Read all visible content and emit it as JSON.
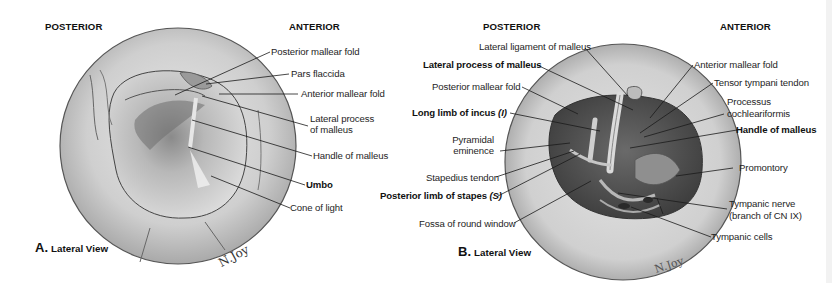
{
  "panel_a": {
    "orientation": {
      "posterior": "POSTERIOR",
      "anterior": "ANTERIOR"
    },
    "caption": {
      "letter": "A.",
      "text": "Lateral View"
    },
    "signature": "N.Joy",
    "labels": [
      {
        "text": "Posterior mallear fold",
        "bold": false
      },
      {
        "text": "Pars flaccida",
        "bold": false
      },
      {
        "text": "Anterior mallear fold",
        "bold": false
      },
      {
        "text": "Lateral process",
        "bold": false
      },
      {
        "text": "of malleus",
        "bold": false
      },
      {
        "text": "Handle of malleus",
        "bold": false
      },
      {
        "text": "Umbo",
        "bold": true
      },
      {
        "text": "Cone of light",
        "bold": false
      }
    ]
  },
  "panel_b": {
    "orientation": {
      "posterior": "POSTERIOR",
      "anterior": "ANTERIOR"
    },
    "caption": {
      "letter": "B.",
      "text": "Lateral View"
    },
    "signature": "N.Joy",
    "labels_left": [
      {
        "text": "Lateral ligament of malleus",
        "bold": false
      },
      {
        "text": "Lateral process of malleus",
        "bold": true
      },
      {
        "text": "Posterior mallear fold",
        "bold": false
      },
      {
        "text": "Long limb of incus",
        "suffix": "(I)",
        "bold": true
      },
      {
        "text": "Pyramidal",
        "bold": false
      },
      {
        "text": "eminence",
        "bold": false
      },
      {
        "text": "Stapedius tendon",
        "bold": false
      },
      {
        "text": "Posterior limb of stapes",
        "suffix": "(S)",
        "bold": true
      },
      {
        "text": "Fossa of round window",
        "bold": false
      }
    ],
    "labels_right": [
      {
        "text": "Anterior mallear fold",
        "bold": false
      },
      {
        "text": "Tensor tympani tendon",
        "bold": false
      },
      {
        "text": "Processus",
        "bold": false
      },
      {
        "text": "cochleariformis",
        "bold": false
      },
      {
        "text": "Handle of malleus",
        "bold": true
      },
      {
        "text": "Promontory",
        "bold": false
      },
      {
        "text": "Tympanic nerve",
        "bold": false
      },
      {
        "text": "(branch of CN IX)",
        "bold": false
      },
      {
        "text": "Tympanic cells",
        "bold": false
      }
    ]
  },
  "colors": {
    "background": "#ffffff",
    "leader_line": "#1a1a1a",
    "membrane_light": "#d9d9d9",
    "membrane_dark": "#5a5a5a",
    "cavity": "#4a4a4a"
  }
}
